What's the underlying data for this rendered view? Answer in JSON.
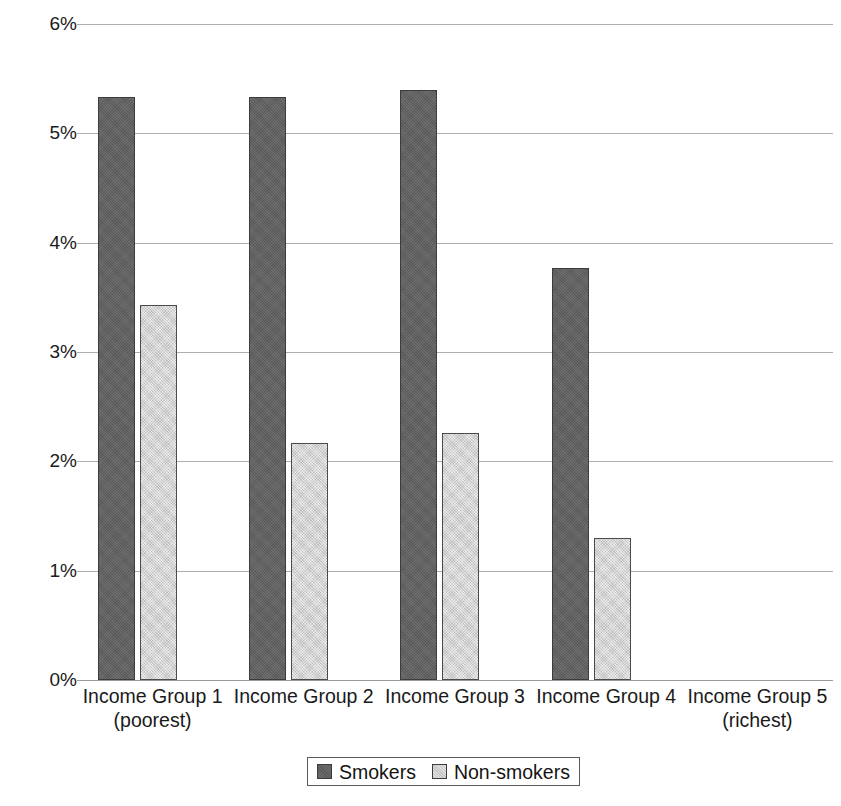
{
  "chart_data": {
    "type": "bar",
    "title": "",
    "subtitle": "",
    "xlabel": "",
    "ylabel": "",
    "categories": [
      "Income Group 1",
      "Income Group 2",
      "Income Group 3",
      "Income Group 4",
      "Income Group 5"
    ],
    "category_sublabels": [
      "(poorest)",
      "",
      "",
      "",
      "(richest)"
    ],
    "series": [
      {
        "name": "Smokers",
        "color": "#616161",
        "values": [
          5.33,
          5.33,
          5.4,
          3.77,
          null
        ]
      },
      {
        "name": "Non-smokers",
        "color": "#d0d0d0",
        "values": [
          3.43,
          2.17,
          2.26,
          1.3,
          null
        ]
      }
    ],
    "ylim": [
      0,
      6
    ],
    "ytick_values": [
      0,
      1,
      2,
      3,
      4,
      5,
      6
    ],
    "ytick_labels": [
      "0%",
      "1%",
      "2%",
      "3%",
      "4%",
      "5%",
      "6%"
    ],
    "grid": true,
    "grid_axis": "y",
    "legend_position": "bottom",
    "value_format": "percent"
  },
  "legend": {
    "items": [
      {
        "label": "Smokers",
        "swatch": "smokers"
      },
      {
        "label": "Non-smokers",
        "swatch": "nonsmokers"
      }
    ]
  }
}
